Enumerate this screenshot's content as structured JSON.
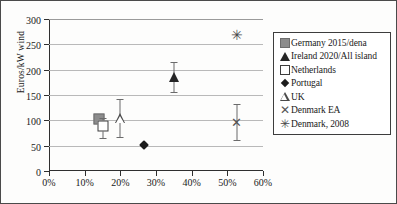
{
  "chart_data": {
    "type": "scatter",
    "title": "",
    "xlabel": "",
    "ylabel": "Euros/kW wind",
    "xlim": [
      0,
      60
    ],
    "ylim": [
      0,
      300
    ],
    "grid": "horizontal",
    "legend_position": "right-outside",
    "x_ticks": [
      "0%",
      "10%",
      "20%",
      "30%",
      "40%",
      "50%",
      "60%"
    ],
    "x_tick_values": [
      0,
      10,
      20,
      30,
      40,
      50,
      60
    ],
    "y_ticks": [
      "0",
      "50",
      "100",
      "150",
      "200",
      "250",
      "300"
    ],
    "y_tick_values": [
      0,
      50,
      100,
      150,
      200,
      250,
      300
    ],
    "series": [
      {
        "name": "Germany 2015/dena",
        "marker": "square-filled",
        "x": 14.0,
        "y": 103,
        "y_low": 96,
        "y_high": 112
      },
      {
        "name": "Ireland 2020/All island",
        "marker": "triangle-filled",
        "x": 35.0,
        "y": 185,
        "y_low": 155,
        "y_high": 216
      },
      {
        "name": "Netherlands",
        "marker": "square-open",
        "x": 15.0,
        "y": 88,
        "y_low": 65,
        "y_high": 104
      },
      {
        "name": "Portugal",
        "marker": "diamond-filled",
        "x": 26.5,
        "y": 52,
        "y_low": null,
        "y_high": null
      },
      {
        "name": "UK",
        "marker": "triangle-open",
        "x": 19.8,
        "y": 104,
        "y_low": 68,
        "y_high": 142
      },
      {
        "name": "Denmark EA",
        "marker": "x-cross",
        "x": 52.7,
        "y": 97,
        "y_low": 62,
        "y_high": 132
      },
      {
        "name": "Denmark, 2008",
        "marker": "star-cross",
        "x": 52.7,
        "y": 268,
        "y_low": null,
        "y_high": null
      }
    ]
  },
  "legend": {
    "items": [
      {
        "label": "Germany 2015/dena",
        "key": "square-filled-icon"
      },
      {
        "label": "Ireland 2020/All island",
        "key": "triangle-filled-icon"
      },
      {
        "label": "Netherlands",
        "key": "square-open-icon"
      },
      {
        "label": "Portugal",
        "key": "diamond-icon"
      },
      {
        "label": "UK",
        "key": "triangle-open-icon"
      },
      {
        "label": "Denmark EA",
        "key": "x-cross-icon"
      },
      {
        "label": "Denmark, 2008",
        "key": "star-cross-icon"
      }
    ],
    "glyphs": {
      "x_cross": "✕",
      "star_cross": "✳"
    }
  }
}
